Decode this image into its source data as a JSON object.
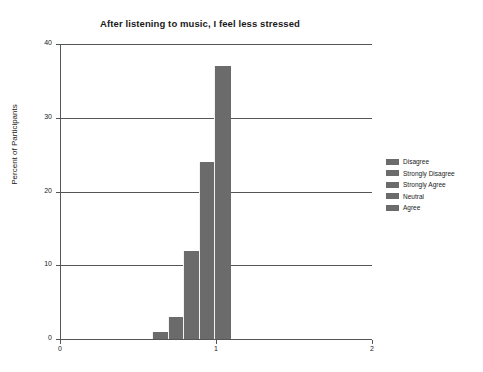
{
  "chart_data": {
    "type": "bar",
    "title": "After listening to music, I feel less stressed",
    "xlabel": "",
    "ylabel": "Percent of Participants",
    "categories": [
      "Disagree",
      "Strongly Disagree",
      "Strongly Agree",
      "Neutral",
      "Agree"
    ],
    "values": [
      1,
      3,
      12,
      24,
      37
    ],
    "bar_centers_x": [
      0.64,
      0.74,
      0.84,
      0.94,
      1.04
    ],
    "bar_width_x": 0.1,
    "ylim": [
      0,
      40
    ],
    "xlim": [
      0,
      2
    ],
    "ytick_labels": [
      "0",
      "10",
      "20",
      "30",
      "40"
    ],
    "ytick_values": [
      0,
      10,
      20,
      30,
      40
    ],
    "xtick_labels": [
      "0",
      "1",
      "2"
    ],
    "xtick_values": [
      0,
      1,
      2
    ],
    "grid": true,
    "legend_position": "right",
    "bar_color": "#6b6b6b",
    "grid_color": "#555555",
    "text_color": "#1a1a1a",
    "background": "#ffffff"
  },
  "legend": {
    "items": [
      {
        "label": "Disagree"
      },
      {
        "label": "Strongly Disagree"
      },
      {
        "label": "Strongly Agree"
      },
      {
        "label": "Neutral"
      },
      {
        "label": "Agree"
      }
    ]
  }
}
